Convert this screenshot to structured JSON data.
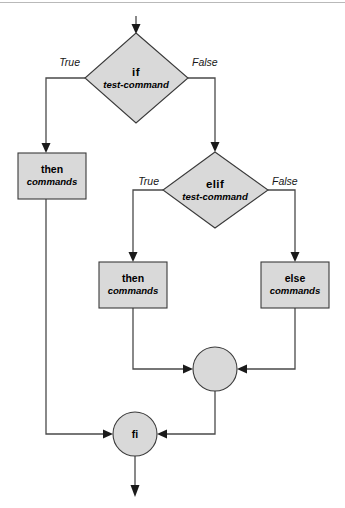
{
  "diagram": {
    "colors": {
      "shape_fill": "#d9d9d9",
      "shape_stroke": "#3a3a3a",
      "line": "#4a4a4a",
      "arrow": "#1a1a1a",
      "text": "#000000",
      "background": "#ffffff"
    },
    "nodes": {
      "if_test": {
        "type": "decision",
        "keyword": "if",
        "detail": "test-command",
        "true_label": "True",
        "false_label": "False"
      },
      "then_outer": {
        "type": "process",
        "keyword": "then",
        "detail": "commands"
      },
      "elif_test": {
        "type": "decision",
        "keyword": "elif",
        "detail": "test-command",
        "true_label": "True",
        "false_label": "False"
      },
      "then_inner": {
        "type": "process",
        "keyword": "then",
        "detail": "commands"
      },
      "else_inner": {
        "type": "process",
        "keyword": "else",
        "detail": "commands"
      },
      "merge_inner": {
        "type": "connector",
        "label": ""
      },
      "fi": {
        "type": "connector",
        "label": "fi"
      }
    }
  }
}
